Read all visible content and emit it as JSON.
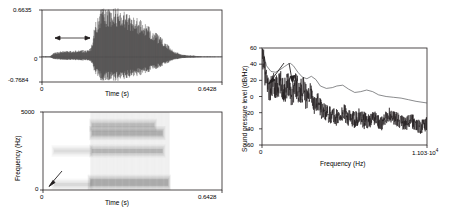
{
  "figure": {
    "title": "",
    "panels": [
      "waveform",
      "spectrogram",
      "spectrum"
    ]
  },
  "waveform": {
    "name": "Nasal murmur waveform",
    "y_max_label": "0.6635",
    "y_zero_label": "0",
    "y_min_label": "-0.7684",
    "x_min_label": "0",
    "x_max_label": "0.6428",
    "xlabel": "Time (s)",
    "annotation": "Nasal murmur",
    "axis_color": "#231f20",
    "trace_color": "#231f20"
  },
  "spectrogram": {
    "name": "Nasal spectrogram",
    "y_max_label": "5000",
    "y_min_label": "0",
    "ylabel": "Frequency (Hz)",
    "x_min_label": "0",
    "x_max_label": "0.6428",
    "xlabel": "Time (s)",
    "annotation": "Nasal formant",
    "axis_color": "#231f20"
  },
  "spectrum": {
    "name": "Nasal spectrum with anti-formants",
    "ylabel": "Sound pressure level (dB/Hz)",
    "y_ticks": [
      "60",
      "40",
      "20",
      "0",
      "-20",
      "-40",
      "-60"
    ],
    "xlabel": "Frequency (Hz)",
    "x_min_label": "0",
    "x_max_mantissa": "1.103",
    "x_max_dot": "·",
    "x_max_base": "10",
    "x_max_exp": "4",
    "annotation": "Anti-formants",
    "axis_color": "#231f20",
    "spectrum_color": "#231f20",
    "envelope_color": "#58595b"
  },
  "chart_data": [
    {
      "type": "line",
      "id": "waveform",
      "title": "Nasal murmur waveform",
      "xlabel": "Time (s)",
      "ylabel": "",
      "xlim": [
        0,
        0.6428
      ],
      "ylim": [
        -0.7684,
        0.6635
      ],
      "xticks": [
        0,
        0.6428
      ],
      "yticks": [
        -0.7684,
        0,
        0.6635
      ],
      "grid": false,
      "annotations": [
        {
          "text": "Nasal murmur",
          "x": 0.1,
          "y": 0.33,
          "arrow": "double-headed horizontal",
          "span_x": [
            0.045,
            0.175
          ]
        }
      ],
      "description": "Time-domain speech waveform: low-amplitude periodic nasal murmur from 0.04-0.17 s, then a large amplitude vowel burst peaking near 0.27 s, decaying to silence by 0.47 s.",
      "envelope_x": [
        0.0,
        0.03,
        0.045,
        0.07,
        0.1,
        0.13,
        0.16,
        0.175,
        0.19,
        0.205,
        0.22,
        0.24,
        0.26,
        0.275,
        0.29,
        0.31,
        0.33,
        0.35,
        0.37,
        0.39,
        0.41,
        0.43,
        0.45,
        0.47,
        0.5,
        0.56,
        0.6428
      ],
      "envelope_y": [
        0.01,
        0.012,
        0.06,
        0.075,
        0.08,
        0.085,
        0.09,
        0.12,
        0.43,
        0.6,
        0.64,
        0.6,
        0.62,
        0.64,
        0.6,
        0.56,
        0.52,
        0.47,
        0.42,
        0.36,
        0.3,
        0.23,
        0.15,
        0.08,
        0.03,
        0.012,
        0.008
      ]
    },
    {
      "type": "heatmap",
      "id": "spectrogram",
      "title": "Nasal spectrogram",
      "xlabel": "Time (s)",
      "ylabel": "Frequency (Hz)",
      "xlim": [
        0,
        0.6428
      ],
      "ylim": [
        0,
        5000
      ],
      "xticks": [
        0,
        0.6428
      ],
      "yticks": [
        0,
        5000
      ],
      "grid": false,
      "annotations": [
        {
          "text": "Nasal formant",
          "x": 0.075,
          "y": 900,
          "arrow": "down-left to (0.055, 250)"
        }
      ],
      "description": "Wideband spectrogram. A faint low-frequency nasal formant band near 300-500 Hz runs from 0.04 s. From 0.17 s onward strong voiced energy appears with dark formant bands near 500 Hz, 2500 Hz and 3600-4200 Hz, ending about 0.47 s.",
      "bands": [
        {
          "center_hz": 480,
          "bandwidth_hz": 430,
          "t_start": 0.17,
          "t_end": 0.45,
          "intensity": 1.0
        },
        {
          "center_hz": 350,
          "bandwidth_hz": 200,
          "t_start": 0.04,
          "t_end": 0.17,
          "intensity": 0.22
        },
        {
          "center_hz": 2500,
          "bandwidth_hz": 260,
          "t_start": 0.175,
          "t_end": 0.43,
          "intensity": 0.8
        },
        {
          "center_hz": 2500,
          "bandwidth_hz": 180,
          "t_start": 0.04,
          "t_end": 0.17,
          "intensity": 0.18
        },
        {
          "center_hz": 3650,
          "bandwidth_hz": 330,
          "t_start": 0.175,
          "t_end": 0.43,
          "intensity": 0.92
        },
        {
          "center_hz": 4150,
          "bandwidth_hz": 260,
          "t_start": 0.175,
          "t_end": 0.4,
          "intensity": 0.7
        }
      ]
    },
    {
      "type": "line",
      "id": "spectrum",
      "title": "Nasal spectrum with anti-formants",
      "xlabel": "Frequency (Hz)",
      "ylabel": "Sound pressure level (dB/Hz)",
      "xlim": [
        0,
        11030
      ],
      "ylim": [
        -60,
        60
      ],
      "xticks": [
        0,
        11030
      ],
      "yticks": [
        -60,
        -40,
        -20,
        0,
        20,
        40,
        60
      ],
      "grid": false,
      "legend": "none",
      "annotations": [
        {
          "text": "Anti-formants",
          "x": 900,
          "y": 48,
          "arrows": [
            "to (600, 12)",
            "to (2000, 4)"
          ]
        }
      ],
      "description": "FFT spectrum (jagged black) with smooth LPC-style envelope (grey). Level falls from about 60 dB/Hz at DC, with envelope peaks near 1.9 kHz (40 dB), 3.3 kHz (22 dB), 5.4 kHz (14 dB), 7.0 kHz (8 dB); spectral anti-formant dips near 0.6 kHz and 2.0 kHz. Jagged spectrum decays from ~30 dB/Hz to about -40 dB/Hz by 11 kHz.",
      "series": [
        {
          "name": "envelope",
          "x": [
            0,
            300,
            600,
            900,
            1200,
            1500,
            1750,
            1900,
            2100,
            2400,
            2700,
            3000,
            3300,
            3600,
            3900,
            4300,
            4700,
            5000,
            5400,
            5800,
            6200,
            6600,
            7000,
            7400,
            7800,
            8300,
            8800,
            9300,
            9800,
            10300,
            11030
          ],
          "y": [
            60,
            38,
            31,
            30,
            33,
            37,
            40,
            41,
            38,
            30,
            24,
            22,
            25,
            21,
            13,
            10,
            11,
            13,
            14,
            9,
            5,
            6,
            8,
            6,
            2,
            0,
            -1,
            -2,
            -4,
            -6,
            -8
          ]
        },
        {
          "name": "spectrum",
          "x": [
            0,
            250,
            500,
            750,
            1000,
            1250,
            1500,
            1750,
            2000,
            2250,
            2500,
            2750,
            3000,
            3250,
            3500,
            3750,
            4000,
            4500,
            5000,
            5500,
            6000,
            6500,
            7000,
            7500,
            8000,
            8500,
            9000,
            9500,
            10000,
            10500,
            11030
          ],
          "y": [
            58,
            22,
            8,
            14,
            10,
            16,
            6,
            18,
            2,
            16,
            4,
            10,
            -4,
            8,
            -12,
            -6,
            -18,
            -22,
            -26,
            -20,
            -30,
            -24,
            -32,
            -26,
            -34,
            -22,
            -28,
            -34,
            -30,
            -38,
            -34
          ]
        }
      ]
    }
  ]
}
